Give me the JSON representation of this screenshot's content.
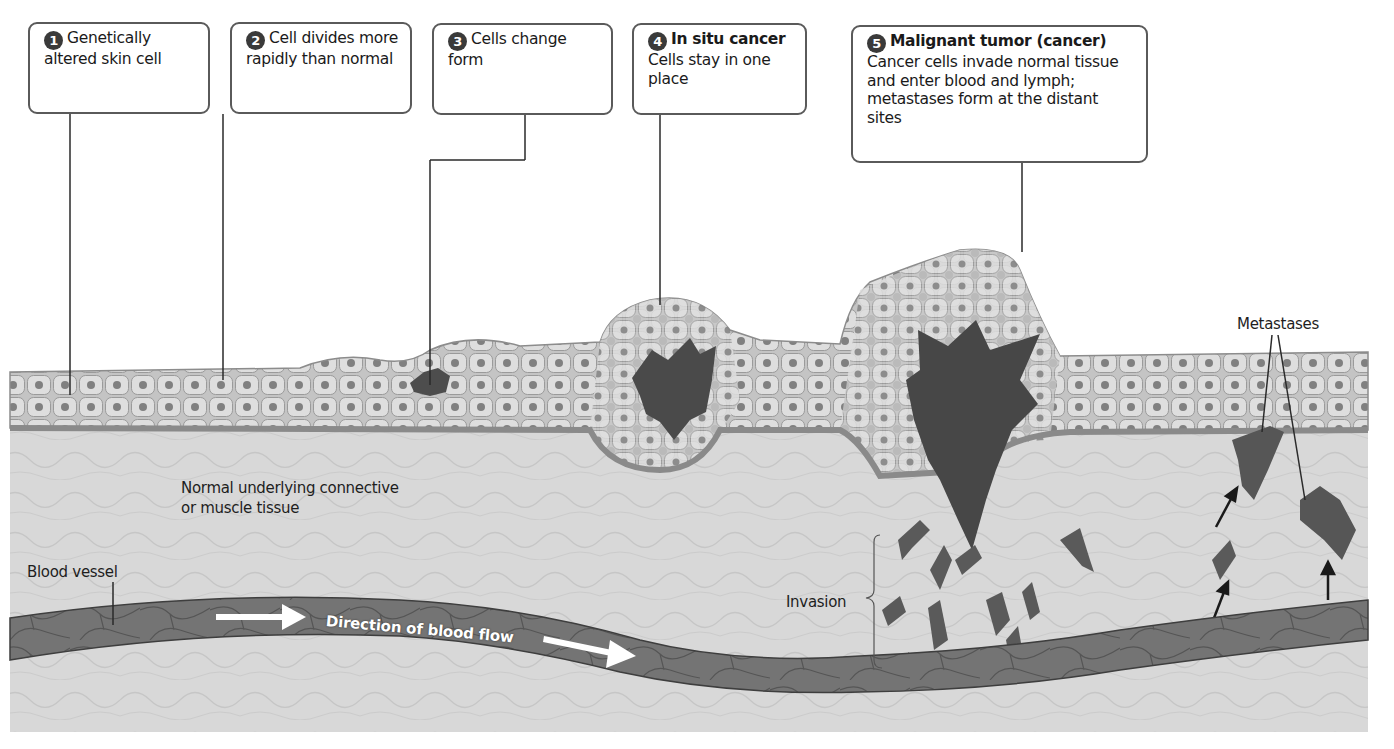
{
  "diagram": {
    "colors": {
      "background": "#ffffff",
      "connective_tissue": "#d6d6d6",
      "epidermis": "#c4c4c4",
      "cell_fill": "#dcdcdc",
      "nucleus": "#7a7a7a",
      "basement_membrane": "#8c8c8c",
      "cancer_cells": "#4a4a4a",
      "blood_vessel": "#6e6e6e",
      "callout_border": "#5a5a5a",
      "number_badge": "#3a3a3a"
    },
    "steps": [
      {
        "number": "1",
        "title": "",
        "text": "Genetically altered skin cell"
      },
      {
        "number": "2",
        "title": "",
        "text": "Cell divides more rapidly than normal"
      },
      {
        "number": "3",
        "title": "",
        "text": "Cells change form"
      },
      {
        "number": "4",
        "title": "In situ cancer",
        "text": "Cells stay in one place"
      },
      {
        "number": "5",
        "title": "Malignant tumor (cancer)",
        "text": "Cancer cells invade normal tissue and enter blood and lymph; metastases form at the distant sites"
      }
    ],
    "labels": {
      "connective_tissue": "Normal underlying connective or muscle tissue",
      "connective_tissue_line1": "Normal underlying connective",
      "connective_tissue_line2": "or muscle tissue",
      "blood_vessel": "Blood vessel",
      "blood_flow": "Direction of blood flow",
      "invasion": "Invasion",
      "metastases": "Metastases"
    }
  }
}
